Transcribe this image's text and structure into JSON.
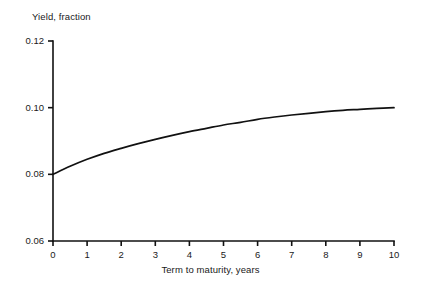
{
  "chart_data": {
    "type": "line",
    "title": "",
    "xlabel": "Term to maturity, years",
    "ylabel": "Yield, fraction",
    "xlim": [
      0,
      10
    ],
    "ylim": [
      0.06,
      0.12
    ],
    "grid": false,
    "legend": null,
    "x_ticks": [
      "0",
      "1",
      "2",
      "3",
      "4",
      "5",
      "6",
      "7",
      "8",
      "9",
      "10"
    ],
    "y_ticks": [
      "0.06",
      "0.08",
      "0.10",
      "0.12"
    ],
    "x": [
      0,
      0.5,
      1,
      1.5,
      2,
      2.5,
      3,
      3.5,
      4,
      4.5,
      5,
      5.5,
      6,
      6.5,
      7,
      7.5,
      8,
      8.5,
      9,
      9.5,
      10
    ],
    "series": [
      {
        "name": "Yield curve",
        "color": "#111111",
        "values": [
          0.08,
          0.0824,
          0.0845,
          0.0863,
          0.0878,
          0.0892,
          0.0905,
          0.0917,
          0.0928,
          0.0938,
          0.0948,
          0.0956,
          0.0965,
          0.0972,
          0.0978,
          0.0983,
          0.0988,
          0.0992,
          0.0995,
          0.0998,
          0.1
        ]
      }
    ]
  },
  "axis": {
    "line_color": "#111111",
    "tick_length": 5
  }
}
